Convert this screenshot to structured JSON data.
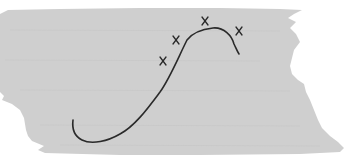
{
  "figure": {
    "colors": {
      "page_background": "#ffffff",
      "brush_background": "#cfcfcf",
      "stroke": "#2a2a2a"
    },
    "marks": [
      {
        "label": "x",
        "x": 163,
        "y": 61
      },
      {
        "label": "x",
        "x": 176,
        "y": 40
      },
      {
        "label": "x",
        "x": 205,
        "y": 21
      },
      {
        "label": "x",
        "x": 239,
        "y": 31
      }
    ],
    "curve_points": [
      [
        73,
        120
      ],
      [
        75,
        135
      ],
      [
        90,
        142
      ],
      [
        110,
        138
      ],
      [
        130,
        125
      ],
      [
        150,
        103
      ],
      [
        170,
        77
      ],
      [
        187,
        39
      ],
      [
        213,
        29
      ],
      [
        238,
        53
      ]
    ]
  }
}
